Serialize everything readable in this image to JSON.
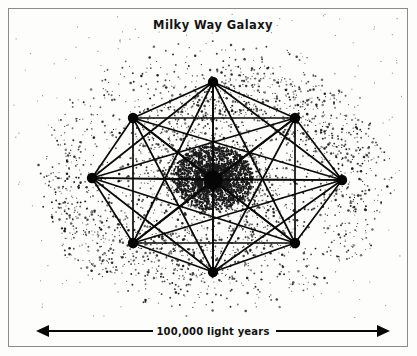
{
  "figure": {
    "title": "Milky Way Galaxy",
    "scale_label": "100,000 light years",
    "background_color": "#fdfdfc",
    "ink_color": "#0a0a0a",
    "frame_color": "#8a8a8a"
  },
  "chart_data": {
    "type": "diagram",
    "title": "Milky Way Galaxy",
    "subtitle": "",
    "xlabel": "",
    "ylabel": "",
    "annotations": [
      "Milky Way Galaxy",
      "100,000 light years"
    ],
    "scale_bar": {
      "label": "100,000 light years",
      "value": 100000,
      "unit": "light years",
      "x_start": 36,
      "x_end": 390,
      "y": 331,
      "arrowheads": "both"
    },
    "network": {
      "description": "complete graph connecting nine galactic nodes",
      "node_count": 9,
      "edge_style": "all-pairs",
      "nodes": [
        {
          "id": "center",
          "label": "",
          "x": 213,
          "y": 180,
          "r": 9.5
        },
        {
          "id": "n-top",
          "label": "",
          "x": 213,
          "y": 82,
          "r": 5.2
        },
        {
          "id": "n-upper-right",
          "label": "",
          "x": 295,
          "y": 118,
          "r": 5.2
        },
        {
          "id": "n-right",
          "label": "",
          "x": 342,
          "y": 180,
          "r": 5.2
        },
        {
          "id": "n-lower-right",
          "label": "",
          "x": 295,
          "y": 243,
          "r": 5.2
        },
        {
          "id": "n-bottom",
          "label": "",
          "x": 213,
          "y": 272,
          "r": 5.2
        },
        {
          "id": "n-lower-left",
          "label": "",
          "x": 133,
          "y": 243,
          "r": 5.2
        },
        {
          "id": "n-left",
          "label": "",
          "x": 92,
          "y": 178,
          "r": 5.2
        },
        {
          "id": "n-upper-left",
          "label": "",
          "x": 133,
          "y": 118,
          "r": 5.2
        }
      ]
    },
    "starfield": {
      "description": "stippled spiral-halo of stars surrounding the galactic core",
      "center_x": 213,
      "center_y": 178,
      "disk_radius_x": 175,
      "disk_radius_y": 140,
      "core_radius": 34,
      "point_count": 5200,
      "dot_color": "#1a1a1a"
    }
  }
}
